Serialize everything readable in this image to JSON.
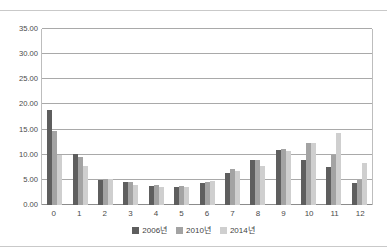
{
  "chart_data": {
    "type": "bar",
    "title": "",
    "xlabel": "",
    "ylabel": "",
    "categories": [
      "0",
      "1",
      "2",
      "3",
      "4",
      "5",
      "6",
      "7",
      "8",
      "9",
      "10",
      "11",
      "12"
    ],
    "ylim": [
      0,
      35
    ],
    "ytick_values": [
      0,
      5,
      10,
      15,
      20,
      25,
      30,
      35
    ],
    "ytick_labels": [
      "0.00",
      "5.00",
      "10.00",
      "15.00",
      "20.00",
      "25.00",
      "30.00",
      "35.00"
    ],
    "grid": true,
    "legend_position": "bottom",
    "series": [
      {
        "name": "2006년",
        "color": "#5e5e5e",
        "values": [
          18.8,
          10.2,
          4.9,
          4.6,
          3.7,
          3.6,
          4.3,
          6.4,
          8.9,
          11.0,
          8.9,
          7.5,
          4.3
        ]
      },
      {
        "name": "2010년",
        "color": "#a3a3a3",
        "values": [
          14.8,
          9.5,
          5.2,
          4.6,
          4.0,
          3.7,
          4.6,
          7.1,
          9.0,
          11.1,
          12.4,
          10.0,
          5.0
        ]
      },
      {
        "name": "2014년",
        "color": "#cfcfcf",
        "values": [
          10.0,
          7.7,
          5.2,
          3.9,
          3.5,
          3.5,
          4.7,
          6.8,
          7.8,
          10.7,
          12.4,
          14.3,
          8.4
        ]
      }
    ]
  }
}
